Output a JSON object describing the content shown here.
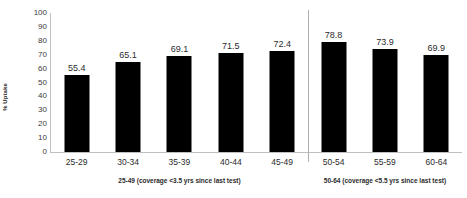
{
  "chart_data": {
    "type": "bar",
    "title": "",
    "xlabel": "",
    "ylabel": "% Uptake",
    "ylim": [
      0,
      100
    ],
    "ytick_step": 10,
    "yticks": [
      100,
      90,
      80,
      70,
      60,
      50,
      40,
      30,
      20,
      10,
      0
    ],
    "grid": false,
    "legend": "none",
    "bar_color": "#000000",
    "categories": [
      "25-29",
      "30-34",
      "35-39",
      "40-44",
      "45-49",
      "50-54",
      "55-59",
      "60-64"
    ],
    "values": [
      55.4,
      65.1,
      69.1,
      71.5,
      72.4,
      78.8,
      73.9,
      69.9
    ],
    "data_labels": [
      "55.4",
      "65.1",
      "69.1",
      "71.5",
      "72.4",
      "78.8",
      "73.9",
      "69.9"
    ],
    "groups": [
      {
        "caption": "25-49 (coverage <3.5 yrs since last test)",
        "categories": [
          "25-29",
          "30-34",
          "35-39",
          "40-44",
          "45-49"
        ]
      },
      {
        "caption": "50-64 (coverage <5.5 yrs since last test)",
        "categories": [
          "50-54",
          "55-59",
          "60-64"
        ]
      }
    ],
    "divider_after_category": "45-49"
  }
}
